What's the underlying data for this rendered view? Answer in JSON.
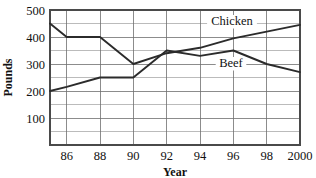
{
  "chart_data": {
    "type": "line",
    "title": "",
    "xlabel": "Year",
    "ylabel": "Pounds",
    "grid": true,
    "legend_position": "inline-on-series",
    "xlim": [
      85,
      2000
    ],
    "ylim": [
      0,
      500
    ],
    "y_ticks": [
      100,
      200,
      300,
      400,
      500
    ],
    "y_tick_labels": [
      "100",
      "200",
      "300",
      "400",
      "500"
    ],
    "y_minor_step": 50,
    "x_ticks": [
      86,
      88,
      90,
      92,
      94,
      96,
      98,
      2000
    ],
    "x_tick_labels": [
      "86",
      "88",
      "90",
      "92",
      "94",
      "96",
      "98",
      "2000"
    ],
    "x": [
      85,
      86,
      88,
      90,
      92,
      94,
      96,
      98,
      2000
    ],
    "series": [
      {
        "name": "Chicken",
        "values": [
          450,
          400,
          400,
          300,
          340,
          360,
          395,
          420,
          445
        ]
      },
      {
        "name": "Beef",
        "values": [
          200,
          215,
          250,
          250,
          350,
          330,
          350,
          300,
          270
        ]
      }
    ]
  },
  "axes": {
    "y_title": "Pounds",
    "x_title": "Year"
  },
  "series_labels": {
    "chicken": "Chicken",
    "beef": "Beef"
  },
  "colors": {
    "line": "#2b2b2b",
    "grid": "#8d8d8d",
    "frame": "#4a4a4a",
    "text": "#111111",
    "background": "#ffffff"
  }
}
